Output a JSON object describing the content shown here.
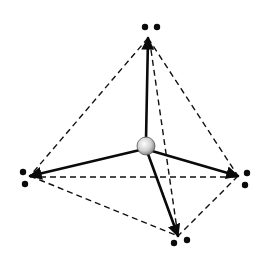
{
  "diagram": {
    "type": "tetrahedral-molecular-geometry",
    "center": {
      "label": "",
      "x": 146,
      "y": 146,
      "r": 9,
      "fill": "#d9d9d9"
    },
    "vertices": [
      {
        "name": "top",
        "x": 148,
        "y": 38,
        "dots": [
          [
            145,
            27
          ],
          [
            157,
            27
          ]
        ]
      },
      {
        "name": "left",
        "x": 30,
        "y": 176,
        "dots": [
          [
            23,
            172
          ],
          [
            25,
            184
          ]
        ]
      },
      {
        "name": "right",
        "x": 238,
        "y": 176,
        "dots": [
          [
            247,
            173
          ],
          [
            245,
            185
          ]
        ]
      },
      {
        "name": "bottom",
        "x": 178,
        "y": 236,
        "dots": [
          [
            174,
            243
          ],
          [
            187,
            240
          ]
        ]
      }
    ],
    "edges_dashed": [
      [
        "top",
        "left"
      ],
      [
        "top",
        "right"
      ],
      [
        "top",
        "bottom"
      ],
      [
        "left",
        "right"
      ],
      [
        "left",
        "bottom"
      ],
      [
        "right",
        "bottom"
      ]
    ],
    "bonds_solid": [
      "top",
      "left",
      "right",
      "bottom"
    ],
    "colors": {
      "line": "#111111",
      "sphere_light": "#f4f4f4",
      "sphere_dark": "#8a8a8a"
    }
  }
}
